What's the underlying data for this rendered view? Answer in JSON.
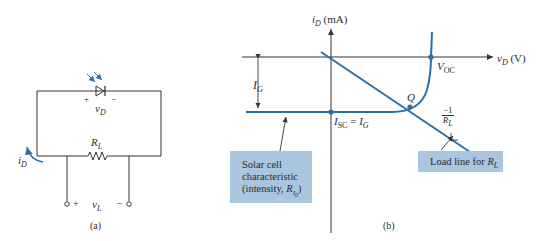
{
  "figure_a": {
    "caption": "(a)",
    "diode_voltage": {
      "symbol": "v",
      "sub": "D",
      "plus": "+",
      "minus": "−"
    },
    "resistor": {
      "symbol": "R",
      "sub": "L"
    },
    "current": {
      "symbol": "i",
      "sub": "D"
    },
    "load_voltage": {
      "symbol": "v",
      "sub": "L",
      "plus": "+",
      "minus": "−"
    }
  },
  "figure_b": {
    "caption": "(b)",
    "y_axis": {
      "symbol": "i",
      "sub": "D",
      "unit": "(mA)"
    },
    "x_axis": {
      "symbol": "v",
      "sub": "D",
      "unit": "(V)"
    },
    "ig_label": {
      "symbol": "I",
      "sub": "G"
    },
    "isc_label": {
      "lhs": "I",
      "lhs_sub": "SC",
      "eq": " = ",
      "rhs": "I",
      "rhs_sub": "G"
    },
    "voc_label": {
      "symbol": "V",
      "sub": "OC"
    },
    "q_label": "Q",
    "slope_label": {
      "num": "−1",
      "den": "R",
      "den_sub": "L"
    },
    "solar_box": {
      "line1": "Solar cell",
      "line2": "characteristic",
      "line3": "(intensity, ",
      "r": "R",
      "r_sub": "I",
      "r_sub2": "0",
      "close": ")"
    },
    "load_box": {
      "text": "Load line for ",
      "r": "R",
      "r_sub": "L"
    }
  },
  "colors": {
    "curve": "#2a6fa8",
    "line": "#333333",
    "box": "#a9c6de"
  }
}
